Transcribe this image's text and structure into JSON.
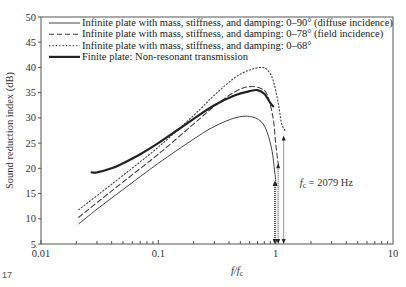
{
  "chart_data": {
    "type": "line",
    "title": "",
    "xlabel": "f/f_c",
    "xlabel_main": "f/f",
    "xlabel_sub": "c",
    "ylabel": "Sound reduction index (dB)",
    "xscale": "log",
    "xlim": [
      0.01,
      10
    ],
    "ylim": [
      5,
      50
    ],
    "x_ticks": [
      0.01,
      0.1,
      1,
      10
    ],
    "x_tick_labels": [
      "0.01",
      "0.1",
      "1",
      "10"
    ],
    "y_ticks": [
      5,
      10,
      15,
      20,
      25,
      30,
      35,
      40,
      45,
      50
    ],
    "y_tick_labels": [
      "5",
      "10",
      "15",
      "20",
      "25",
      "30",
      "35",
      "40",
      "45",
      "50"
    ],
    "grid": false,
    "legend_position": "upper left",
    "series": [
      {
        "name": "Infinite plate with mass, stiffness, and damping: 0–90° (diffuse incidence)",
        "style": "solid-thin",
        "x": [
          0.021,
          0.03,
          0.05,
          0.1,
          0.2,
          0.3,
          0.45,
          0.6,
          0.75,
          0.85,
          0.93,
          0.98,
          1.0
        ],
        "y": [
          9.0,
          11.9,
          15.8,
          21.0,
          25.8,
          28.3,
          30.0,
          30.3,
          29.3,
          27.0,
          23.5,
          19.5,
          17.5
        ]
      },
      {
        "name": "Infinite plate with mass, stiffness, and damping: 0–78° (field incidence)",
        "style": "dashed",
        "x": [
          0.021,
          0.03,
          0.05,
          0.1,
          0.2,
          0.3,
          0.45,
          0.6,
          0.75,
          0.85,
          0.95,
          1.0,
          1.05,
          1.08
        ],
        "y": [
          10.3,
          13.2,
          17.3,
          22.8,
          28.8,
          32.3,
          35.2,
          36.2,
          35.8,
          34.5,
          30.0,
          25.0,
          21.0,
          20.0
        ]
      },
      {
        "name": "Infinite plate with mass, stiffness, and damping: 0–68°",
        "style": "dotted",
        "x": [
          0.021,
          0.03,
          0.05,
          0.1,
          0.2,
          0.3,
          0.45,
          0.6,
          0.75,
          0.85,
          0.95,
          1.05,
          1.12,
          1.2
        ],
        "y": [
          11.8,
          14.6,
          18.6,
          24.2,
          30.5,
          34.5,
          38.0,
          39.5,
          40.0,
          39.5,
          37.5,
          33.0,
          29.0,
          27.5
        ]
      },
      {
        "name": "Finite plate: Non-resonant transmission",
        "style": "solid-thick",
        "x": [
          0.027,
          0.03,
          0.04,
          0.05,
          0.07,
          0.1,
          0.15,
          0.2,
          0.3,
          0.45,
          0.6,
          0.7,
          0.8,
          0.9,
          0.95
        ],
        "y": [
          19.2,
          19.2,
          20.0,
          21.0,
          22.8,
          25.0,
          27.8,
          29.8,
          32.5,
          34.5,
          35.3,
          35.5,
          34.8,
          33.0,
          32.3
        ]
      }
    ],
    "annotations": [
      {
        "text_main": "f",
        "text_sub": "c",
        "text_rest": " = 2079 Hz",
        "x": 1.7,
        "y": 17
      }
    ],
    "arrows": [
      {
        "x": 0.98,
        "from_y": 17.5,
        "to_y": 5
      },
      {
        "x": 1.0,
        "from_y": 17.5,
        "to_y": 5
      },
      {
        "x": 1.05,
        "from_y": 21.0,
        "to_y": 5
      },
      {
        "x": 1.17,
        "from_y": 26.5,
        "to_y": 5
      }
    ]
  },
  "figure_number": "17"
}
